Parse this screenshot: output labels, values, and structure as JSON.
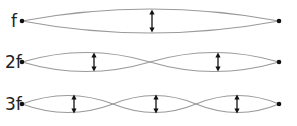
{
  "diagram": {
    "type": "standing-wave-harmonics",
    "colors": {
      "wave": "#9a9a9a",
      "arrow": "#111111",
      "node": "#111111",
      "label": "#222222"
    },
    "rows": [
      {
        "label": "f",
        "loops": 1
      },
      {
        "label": "2f",
        "loops": 2
      },
      {
        "label": "3f",
        "loops": 3
      }
    ]
  }
}
